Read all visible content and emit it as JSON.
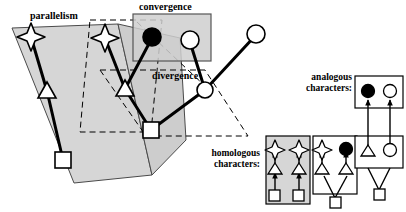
{
  "figure": {
    "background": "#ffffff",
    "line_color": "#000000",
    "plane_fill": "#d4d4d4",
    "box_fill_shaded": "#d4d4d4"
  },
  "labels": {
    "parallelism": "parallelism",
    "convergence": "convergence",
    "divergence": "divergence",
    "analogous": "analogous\ncharacters:",
    "analogous_line1": "analogous",
    "analogous_line2": "characters:",
    "homologous": "homologous\ncharacters:",
    "homologous_line1": "homologous",
    "homologous_line2": "characters:"
  },
  "glyph_legend": {
    "square": "open-square-node",
    "triangle": "open-triangle-node",
    "star": "open-star-node",
    "filled_circle": "filled-circle-node",
    "open_circle": "open-circle-node"
  },
  "main_diagram": {
    "description": "Two shaded evolutionary planes with character state lineages; dashed outlines mark the parallelism, convergence and divergence regions.",
    "nodes": [
      {
        "id": "root-square-left",
        "shape": "square",
        "x": 63,
        "y": 160
      },
      {
        "id": "triangle-left",
        "shape": "triangle",
        "x": 47,
        "y": 91
      },
      {
        "id": "star-left",
        "shape": "star",
        "x": 30,
        "y": 35
      },
      {
        "id": "root-square-mid",
        "shape": "square",
        "x": 151,
        "y": 130
      },
      {
        "id": "triangle-mid",
        "shape": "triangle",
        "x": 125,
        "y": 89
      },
      {
        "id": "star-mid",
        "shape": "star",
        "x": 104,
        "y": 36
      },
      {
        "id": "filled-circle-conv",
        "shape": "filled-circle",
        "x": 152,
        "y": 36
      },
      {
        "id": "open-circle-conv",
        "shape": "open-circle",
        "x": 190,
        "y": 40
      },
      {
        "id": "divergence-node",
        "shape": "open-circle",
        "x": 205,
        "y": 90
      },
      {
        "id": "open-circle-right",
        "shape": "open-circle",
        "x": 256,
        "y": 34
      }
    ],
    "edges": [
      {
        "from": "root-square-left",
        "to": "triangle-left"
      },
      {
        "from": "triangle-left",
        "to": "star-left"
      },
      {
        "from": "root-square-mid",
        "to": "triangle-mid"
      },
      {
        "from": "triangle-mid",
        "to": "star-mid"
      },
      {
        "from": "triangle-mid",
        "to": "filled-circle-conv"
      },
      {
        "from": "root-square-mid",
        "to": "divergence-node"
      },
      {
        "from": "divergence-node",
        "to": "open-circle-conv"
      },
      {
        "from": "divergence-node",
        "to": "open-circle-right"
      }
    ]
  },
  "homologous_panels": [
    {
      "id": "panel-parallelism",
      "caption_role": "parallelism example",
      "shaded": true,
      "lineages": [
        {
          "chain": [
            "square",
            "triangle",
            "star"
          ]
        },
        {
          "chain": [
            "square",
            "triangle",
            "star"
          ]
        }
      ],
      "shared_root": false
    },
    {
      "id": "panel-divergence",
      "caption_role": "divergence example",
      "shaded": false,
      "shared_root": true,
      "root": "square",
      "lineages": [
        {
          "chain": [
            "triangle",
            "star"
          ]
        },
        {
          "chain": [
            "triangle",
            "filled-circle"
          ]
        }
      ]
    }
  ],
  "analogous_panel": {
    "id": "panel-convergence",
    "caption_role": "convergence example",
    "top_box": {
      "shaded": false,
      "nodes": [
        "filled-circle",
        "open-circle"
      ]
    },
    "bottom_box": {
      "shaded": false,
      "nodes": [
        "triangle",
        "open-circle"
      ]
    },
    "shared_root": true,
    "root": "square",
    "arrows": 2
  }
}
